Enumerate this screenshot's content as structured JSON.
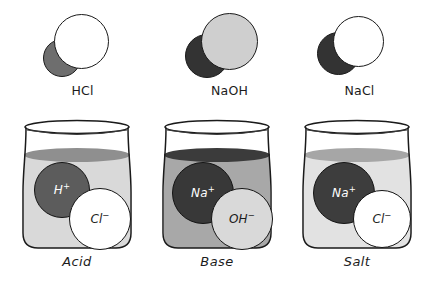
{
  "figure": {
    "width": 431,
    "height": 285,
    "background": "#ffffff"
  },
  "palette": {
    "outline": "#1a1a1a",
    "white_atom": "#ffffff",
    "light_gray_atom": "#cfcfcf",
    "mid_gray_atom": "#6e6e6e",
    "dark_gray_atom": "#4a4a4a",
    "very_dark_atom": "#333333",
    "acid_liquid": "#d9d9d9",
    "acid_surface": "#8f8f8f",
    "base_liquid": "#a8a8a8",
    "base_surface": "#3b3b3b",
    "salt_liquid": "#e2e2e2",
    "salt_surface": "#a6a6a6",
    "glass_fill": "#ffffff",
    "text_dark": "#1c1c1c",
    "text_light": "#ffffff"
  },
  "molecules": [
    {
      "id": "hcl",
      "label": "HCl",
      "compound_name": "hydrogen chloride",
      "atoms": [
        {
          "name": "hydrogen",
          "symbol": "H",
          "color": "#6e6e6e",
          "role": "back-left",
          "diameter": 37
        },
        {
          "name": "chlorine",
          "symbol": "Cl",
          "color": "#ffffff",
          "role": "front-right",
          "diameter": 55
        }
      ]
    },
    {
      "id": "naoh",
      "label": "NaOH",
      "compound_name": "sodium hydroxide",
      "atoms": [
        {
          "name": "sodium",
          "symbol": "Na",
          "color": "#333333",
          "role": "back-left",
          "diameter": 43
        },
        {
          "name": "hydroxide",
          "symbol": "OH",
          "color": "#cfcfcf",
          "role": "front-right",
          "diameter": 57
        }
      ]
    },
    {
      "id": "nacl",
      "label": "NaCl",
      "compound_name": "sodium chloride",
      "atoms": [
        {
          "name": "sodium",
          "symbol": "Na",
          "color": "#333333",
          "role": "back-left",
          "diameter": 42
        },
        {
          "name": "chlorine",
          "symbol": "Cl",
          "color": "#ffffff",
          "role": "front-right",
          "diameter": 50
        }
      ]
    }
  ],
  "beakers": [
    {
      "id": "acid",
      "caption": "Acid",
      "liquid_color": "#d9d9d9",
      "surface_color": "#8f8f8f",
      "ions": [
        {
          "name": "hydrogen-ion",
          "text": "H",
          "charge": "+",
          "fill": "#5c5c5c",
          "text_color": "#ffffff",
          "diameter": 55,
          "position": "upper-left"
        },
        {
          "name": "chloride-ion",
          "text": "Cl",
          "charge": "−",
          "fill": "#ffffff",
          "text_color": "#1c1c1c",
          "diameter": 62,
          "position": "lower-right"
        }
      ]
    },
    {
      "id": "base",
      "caption": "Base",
      "liquid_color": "#a8a8a8",
      "surface_color": "#3b3b3b",
      "ions": [
        {
          "name": "sodium-ion",
          "text": "Na",
          "charge": "+",
          "fill": "#383838",
          "text_color": "#ffffff",
          "diameter": 62,
          "position": "upper-left"
        },
        {
          "name": "hydroxide-ion",
          "text": "OH",
          "charge": "−",
          "fill": "#d9d9d9",
          "text_color": "#1c1c1c",
          "diameter": 62,
          "position": "lower-right"
        }
      ]
    },
    {
      "id": "salt",
      "caption": "Salt",
      "liquid_color": "#e2e2e2",
      "surface_color": "#a6a6a6",
      "ions": [
        {
          "name": "sodium-ion",
          "text": "Na",
          "charge": "+",
          "fill": "#3d3d3d",
          "text_color": "#ffffff",
          "diameter": 62,
          "position": "upper-left"
        },
        {
          "name": "chloride-ion",
          "text": "Cl",
          "charge": "−",
          "fill": "#ffffff",
          "text_color": "#1c1c1c",
          "diameter": 58,
          "position": "lower-right"
        }
      ]
    }
  ]
}
